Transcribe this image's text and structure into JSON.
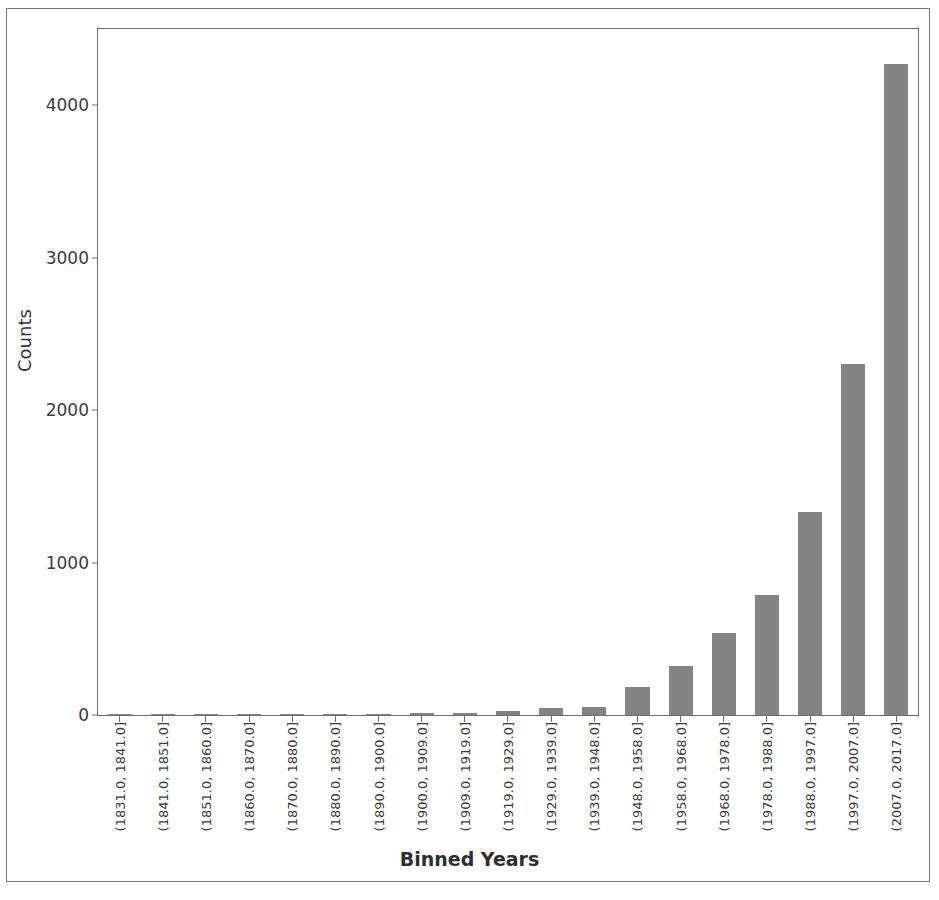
{
  "chart_data": {
    "type": "bar",
    "title": "",
    "xlabel": "Binned Years",
    "ylabel": "Counts",
    "ylim": [
      0,
      4500
    ],
    "yticks": [
      0,
      1000,
      2000,
      3000,
      4000
    ],
    "ytick_labels": [
      "0",
      "1000",
      "2000",
      "3000",
      "4000"
    ],
    "grid": false,
    "legend": null,
    "bar_color": "#848484",
    "axes_color": "#6d6d6d",
    "categories": [
      "(1831.0, 1841.0]",
      "(1841.0, 1851.0]",
      "(1851.0, 1860.0]",
      "(1860.0, 1870.0]",
      "(1870.0, 1880.0]",
      "(1880.0, 1890.0]",
      "(1890.0, 1900.0]",
      "(1900.0, 1909.0]",
      "(1909.0, 1919.0]",
      "(1919.0, 1929.0]",
      "(1929.0, 1939.0]",
      "(1939.0, 1948.0]",
      "(1948.0, 1958.0]",
      "(1958.0, 1968.0]",
      "(1968.0, 1978.0]",
      "(1978.0, 1988.0]",
      "(1988.0, 1997.0]",
      "(1997.0, 2007.0]",
      "(2007.0, 2017.0]"
    ],
    "values": [
      2,
      2,
      2,
      2,
      3,
      4,
      8,
      10,
      15,
      25,
      45,
      50,
      185,
      320,
      540,
      790,
      1330,
      2300,
      4270
    ]
  }
}
